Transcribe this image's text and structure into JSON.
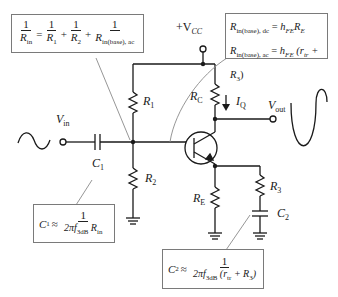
{
  "diagram": {
    "type": "common-emitter BJT amplifier with voltage-divider bias",
    "supply_label": "+V",
    "supply_sub": "CC",
    "input_label": "V",
    "input_sub": "in",
    "output_label": "V",
    "output_sub": "out",
    "current_label": "I",
    "current_sub": "Q",
    "components": {
      "R1": {
        "name": "R",
        "sub": "1"
      },
      "R2": {
        "name": "R",
        "sub": "2"
      },
      "RC": {
        "name": "R",
        "sub": "C"
      },
      "RE": {
        "name": "R",
        "sub": "E"
      },
      "R3": {
        "name": "R",
        "sub": "3"
      },
      "C1": {
        "name": "C",
        "sub": "1"
      },
      "C2": {
        "name": "C",
        "sub": "2"
      }
    },
    "equations": {
      "rin": {
        "lhs_num": "1",
        "lhs_den": "R",
        "lhs_den_sub": "in",
        "eq": "=",
        "t1_num": "1",
        "t1_den": "R",
        "t1_den_sub": "1",
        "plus1": "+",
        "t2_num": "1",
        "t2_den": "R",
        "t2_den_sub": "2",
        "plus2": "+",
        "t3_num": "1",
        "t3_den": "R",
        "t3_den_sub": "in(base), ac"
      },
      "rbase": {
        "line1_lhs": "R",
        "line1_lhs_sub": "in(base), dc",
        "line1_eq": "=",
        "line1_rhs": "h",
        "line1_rhs_sub": "FE",
        "line1_rhs2": "R",
        "line1_rhs2_sub": "E",
        "line2_lhs": "R",
        "line2_lhs_sub": "in(base), ac",
        "line2_eq": "=",
        "line2_rhs": "h",
        "line2_rhs_sub": "FE",
        "line2_paren_open": "(r",
        "line2_r_sub": "tr",
        "line2_plus": "+ R",
        "line2_r3_sub": "3",
        "line2_paren_close": ")"
      },
      "c1": {
        "lhs": "C",
        "lhs_sub": "1",
        "approx": "≈",
        "num": "1",
        "den_pre": "2πf",
        "den_sub": "3dB",
        "den_r": "R",
        "den_r_sub": "in"
      },
      "c2": {
        "lhs": "C",
        "lhs_sub": "2",
        "approx": "≈",
        "num": "1",
        "den_pre": "2πf",
        "den_sub": "3dB",
        "den_mid": "(r",
        "den_tr_sub": "tr",
        "den_plus": "+ R",
        "den_r3_sub": "3",
        "den_close": ")"
      }
    }
  }
}
